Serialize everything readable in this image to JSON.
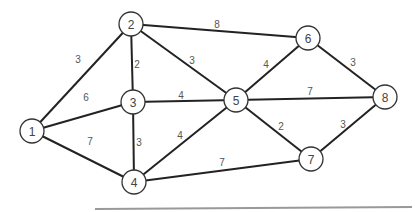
{
  "graph": {
    "nodes": [
      {
        "id": "1",
        "label": "1",
        "x": 32,
        "y": 131
      },
      {
        "id": "2",
        "label": "2",
        "x": 131,
        "y": 24
      },
      {
        "id": "3",
        "label": "3",
        "x": 133,
        "y": 102
      },
      {
        "id": "4",
        "label": "4",
        "x": 134,
        "y": 182
      },
      {
        "id": "5",
        "label": "5",
        "x": 236,
        "y": 100
      },
      {
        "id": "6",
        "label": "6",
        "x": 308,
        "y": 38
      },
      {
        "id": "7",
        "label": "7",
        "x": 311,
        "y": 159
      },
      {
        "id": "8",
        "label": "8",
        "x": 385,
        "y": 97
      }
    ],
    "edges": [
      {
        "from": "1",
        "to": "2",
        "weight": "3",
        "lx": 78,
        "ly": 59
      },
      {
        "from": "1",
        "to": "3",
        "weight": "6",
        "lx": 86,
        "ly": 97
      },
      {
        "from": "1",
        "to": "4",
        "weight": "7",
        "lx": 90,
        "ly": 141
      },
      {
        "from": "2",
        "to": "3",
        "weight": "2",
        "lx": 137,
        "ly": 64
      },
      {
        "from": "2",
        "to": "5",
        "weight": "3",
        "lx": 192,
        "ly": 60
      },
      {
        "from": "2",
        "to": "6",
        "weight": "8",
        "lx": 217,
        "ly": 24
      },
      {
        "from": "3",
        "to": "5",
        "weight": "4",
        "lx": 181,
        "ly": 95
      },
      {
        "from": "3",
        "to": "4",
        "weight": "3",
        "lx": 139,
        "ly": 142
      },
      {
        "from": "4",
        "to": "5",
        "weight": "4",
        "lx": 180,
        "ly": 135
      },
      {
        "from": "4",
        "to": "7",
        "weight": "7",
        "lx": 222,
        "ly": 162
      },
      {
        "from": "5",
        "to": "6",
        "weight": "4",
        "lx": 266,
        "ly": 64
      },
      {
        "from": "5",
        "to": "8",
        "weight": "7",
        "lx": 310,
        "ly": 91
      },
      {
        "from": "5",
        "to": "7",
        "weight": "2",
        "lx": 281,
        "ly": 126
      },
      {
        "from": "6",
        "to": "8",
        "weight": "3",
        "lx": 353,
        "ly": 62
      },
      {
        "from": "7",
        "to": "8",
        "weight": "3",
        "lx": 343,
        "ly": 124
      }
    ],
    "node_radius": 12,
    "colors": {
      "edge": "#222222",
      "node_stroke": "#333333",
      "label": "#444444",
      "baseline": "#999999"
    }
  }
}
